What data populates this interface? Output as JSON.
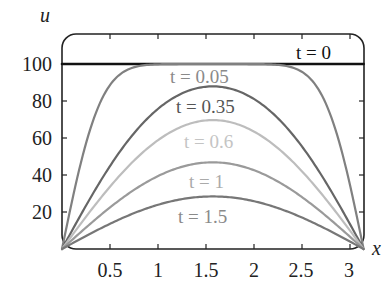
{
  "chart_data": {
    "type": "line",
    "title": "",
    "xlabel": "x",
    "ylabel": "u",
    "xlim": [
      0,
      3.1416
    ],
    "ylim": [
      0,
      115
    ],
    "grid": false,
    "legend_position": "inline labels on curves",
    "x_ticks": [
      0.5,
      1,
      1.5,
      2,
      2.5,
      3
    ],
    "x_tick_labels": [
      "0.5",
      "1",
      "1.5",
      "2",
      "2.5",
      "3"
    ],
    "y_ticks": [
      20,
      40,
      60,
      80,
      100
    ],
    "y_tick_labels": [
      "20",
      "40",
      "60",
      "80",
      "100"
    ],
    "series": [
      {
        "name": "t = 0",
        "t": 0,
        "color": "#111111",
        "width": 2.6,
        "peak": 100,
        "label": "t = 0",
        "label_color": "#111111"
      },
      {
        "name": "t = 0.05",
        "t": 0.05,
        "color": "#808080",
        "width": 2.2,
        "peak": 99.9,
        "label": "t = 0.05",
        "label_color": "#8a8a8a"
      },
      {
        "name": "t = 0.35",
        "t": 0.35,
        "color": "#666666",
        "width": 2.2,
        "peak": 89.7,
        "label": "t = 0.35",
        "label_color": "#555555"
      },
      {
        "name": "t = 0.6",
        "t": 0.6,
        "color": "#bdbdbd",
        "width": 2.2,
        "peak": 69.9,
        "label": "t = 0.6",
        "label_color": "#c4c4c4"
      },
      {
        "name": "t = 1",
        "t": 1,
        "color": "#9a9a9a",
        "width": 2.2,
        "peak": 46.8,
        "label": "t = 1",
        "label_color": "#aaaaaa"
      },
      {
        "name": "t = 1.5",
        "t": 1.5,
        "color": "#777777",
        "width": 2.2,
        "peak": 28.4,
        "label": "t = 1.5",
        "label_color": "#8a8a8a"
      }
    ],
    "formula": "u(x,t) = sum over odd n of (400/(n*pi)) sin(n x) exp(-n^2 t)"
  },
  "axes": {
    "x_label": "x",
    "y_label": "u"
  },
  "labels": {
    "t0": "t = 0",
    "t005": "t = 0.05",
    "t035": "t = 0.35",
    "t06": "t = 0.6",
    "t1": "t = 1",
    "t15": "t = 1.5"
  },
  "ticks": {
    "x": [
      "0.5",
      "1",
      "1.5",
      "2",
      "2.5",
      "3"
    ],
    "y": [
      "20",
      "40",
      "60",
      "80",
      "100"
    ]
  }
}
